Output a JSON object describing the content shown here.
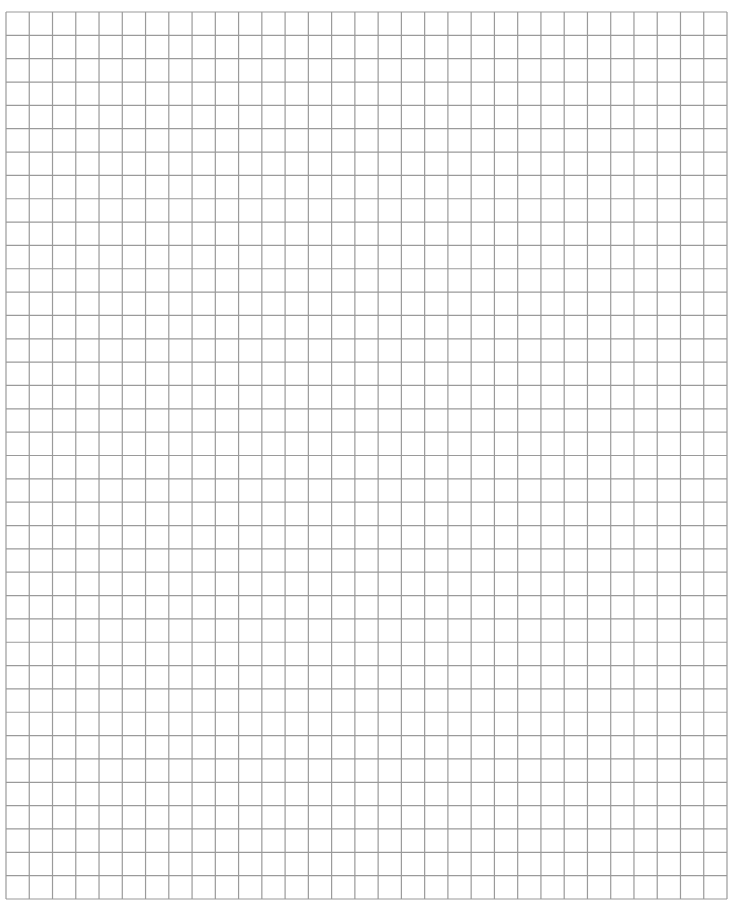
{
  "sheet": {
    "type": "graph-paper",
    "columns": 31,
    "rows": 38,
    "line_color": "#9a9a9a",
    "background_color": "#ffffff"
  }
}
